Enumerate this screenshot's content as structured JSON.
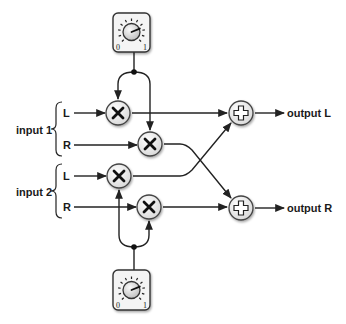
{
  "diagram": {
    "inputs": [
      {
        "label": "input 1",
        "channels": [
          "L",
          "R"
        ]
      },
      {
        "label": "input 2",
        "channels": [
          "L",
          "R"
        ]
      }
    ],
    "outputs": [
      "output L",
      "output R"
    ],
    "multiply_symbol": "×",
    "add_symbol": "+",
    "knobs": [
      {
        "id": "top",
        "min_label": "0",
        "max_label": "1",
        "value": 0.75
      },
      {
        "id": "bottom",
        "min_label": "0",
        "max_label": "1",
        "value": 0.75
      }
    ],
    "colors": {
      "line": "#222222",
      "node_fill": "#f2f2f2",
      "knob_box": "#eeeeee"
    }
  }
}
